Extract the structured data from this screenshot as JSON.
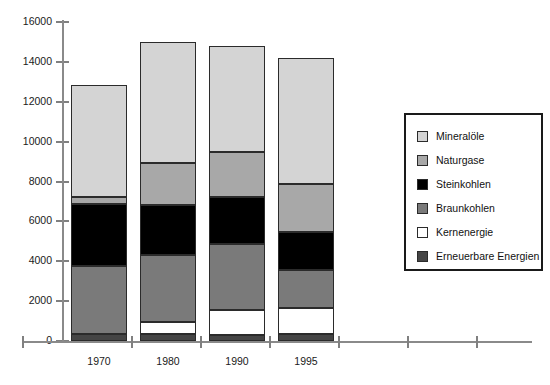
{
  "chart_data": {
    "type": "bar",
    "stacked": true,
    "title": "",
    "subtitle": "",
    "xlabel": "",
    "ylabel": "",
    "categories": [
      "1970",
      "1980",
      "1990",
      "1995"
    ],
    "ylim": [
      0,
      16000
    ],
    "ytick_labels": [
      "0",
      "2000",
      "4000",
      "6000",
      "8000",
      "10000",
      "12000",
      "14000",
      "16000"
    ],
    "ytick_values": [
      0,
      2000,
      4000,
      6000,
      8000,
      10000,
      12000,
      14000,
      16000
    ],
    "grid": false,
    "legend_position": "right",
    "stack_order_bottom_to_top": [
      "Erneuerbare Energien",
      "Kernenergie",
      "Braunkohlen",
      "Steinkohlen",
      "Naturgase",
      "Mineralöle"
    ],
    "series": [
      {
        "name": "Erneuerbare Energien",
        "color": "#454545",
        "values": [
          350,
          350,
          300,
          350
        ]
      },
      {
        "name": "Kernenergie",
        "color": "#ffffff",
        "values": [
          0,
          600,
          1250,
          1300
        ]
      },
      {
        "name": "Braunkohlen",
        "color": "#7a7a7a",
        "values": [
          3400,
          3350,
          3300,
          1900
        ]
      },
      {
        "name": "Steinkohlen",
        "color": "#000000",
        "values": [
          3100,
          2500,
          2350,
          1900
        ]
      },
      {
        "name": "Naturgase",
        "color": "#a8a8a8",
        "values": [
          350,
          2150,
          2300,
          2400
        ]
      },
      {
        "name": "Mineralöle",
        "color": "#d4d4d4",
        "values": [
          5650,
          6050,
          5300,
          6350
        ]
      }
    ],
    "totals": [
      12950,
      15000,
      14800,
      14200
    ]
  },
  "legend": {
    "items": [
      {
        "label": "Mineralöle",
        "color": "#d4d4d4"
      },
      {
        "label": "Naturgase",
        "color": "#a8a8a8"
      },
      {
        "label": "Steinkohlen",
        "color": "#000000"
      },
      {
        "label": "Braunkohlen",
        "color": "#7a7a7a"
      },
      {
        "label": "Kernenergie",
        "color": "#ffffff"
      },
      {
        "label": "Erneuerbare Energien",
        "color": "#454545"
      }
    ]
  }
}
